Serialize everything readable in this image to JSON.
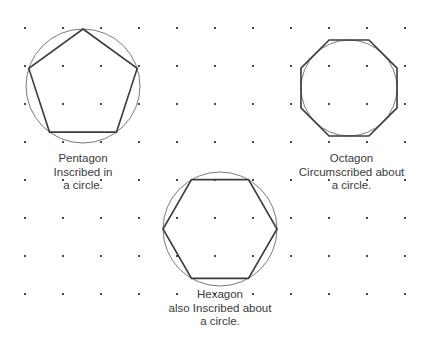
{
  "canvas": {
    "width": 432,
    "height": 345,
    "background_color": "#ffffff"
  },
  "grid": {
    "name": "dot-grid",
    "dot_color": "#4a4a4a",
    "dot_size_px": 2,
    "spacing_x": 38,
    "spacing_y": 38,
    "origin_x": 25,
    "origin_y": 28,
    "columns": 11,
    "rows": 8
  },
  "style": {
    "polygon_stroke": "#3c3c3c",
    "polygon_stroke_width": 1.6,
    "circle_stroke": "#7a7a7a",
    "circle_stroke_width": 1.0,
    "fill": "none",
    "text_color": "#3a3a3a"
  },
  "figures": [
    {
      "id": "pentagon",
      "shape_name": "pentagon",
      "sides": 5,
      "relationship": "inscribed",
      "circle": {
        "cx": 83,
        "cy": 86,
        "r": 57
      },
      "polygon": {
        "cx": 83,
        "cy": 86,
        "r": 57,
        "rotation_deg": -90
      },
      "caption_lines": [
        "Pentagon",
        "Inscribed in",
        "a circle."
      ],
      "caption_x": 13,
      "caption_y": 152,
      "caption_width": 140
    },
    {
      "id": "octagon",
      "shape_name": "octagon",
      "sides": 8,
      "relationship": "circumscribed",
      "circle": {
        "cx": 349,
        "cy": 88,
        "r": 48
      },
      "polygon": {
        "cx": 349,
        "cy": 88,
        "r": 52,
        "rotation_deg": 22.5
      },
      "caption_lines": [
        "Octagon",
        "Circumscribed about",
        "a circle."
      ],
      "caption_x": 279,
      "caption_y": 152,
      "caption_width": 145
    },
    {
      "id": "hexagon",
      "shape_name": "hexagon",
      "sides": 6,
      "relationship": "inscribed",
      "circle": {
        "cx": 220,
        "cy": 229,
        "r": 57
      },
      "polygon": {
        "cx": 220,
        "cy": 229,
        "r": 57,
        "rotation_deg": 0
      },
      "caption_lines": [
        "Hexagon",
        "also Inscribed about",
        "a circle."
      ],
      "caption_x": 147,
      "caption_y": 288,
      "caption_width": 146
    }
  ]
}
